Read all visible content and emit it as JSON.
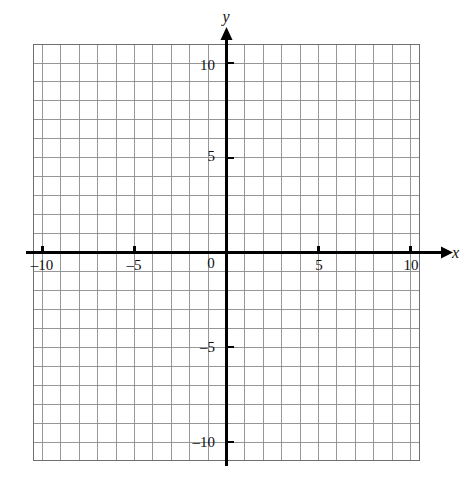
{
  "figure": {
    "background_color": "#ffffff",
    "axis_color": "#000000",
    "grid_color": "#8c8c8c"
  },
  "chart_data": {
    "type": "scatter",
    "title": "",
    "xlabel": "x",
    "ylabel": "y",
    "xlim": [
      -10.5,
      10.5
    ],
    "ylim": [
      -11,
      11
    ],
    "grid": true,
    "grid_step": 1,
    "legend": "none",
    "series": [],
    "x": [],
    "y": [],
    "annotations": [],
    "origin_label": "0",
    "x_tick_labels": [
      "-10",
      "-5",
      "5",
      "10"
    ],
    "x_tick_values": [
      -10,
      -5,
      5,
      10
    ],
    "y_tick_labels": [
      "10",
      "5",
      "-5",
      "-10"
    ],
    "y_tick_values": [
      10,
      5,
      -5,
      -10
    ],
    "minor_tick_values_x": [
      -10,
      -9,
      -8,
      -7,
      -6,
      -5,
      -4,
      -3,
      -2,
      -1,
      0,
      1,
      2,
      3,
      4,
      5,
      6,
      7,
      8,
      9,
      10
    ],
    "minor_tick_values_y": [
      -10,
      -9,
      -8,
      -7,
      -6,
      -5,
      -4,
      -3,
      -2,
      -1,
      0,
      1,
      2,
      3,
      4,
      5,
      6,
      7,
      8,
      9,
      10
    ]
  },
  "labels": {
    "x_axis_name": "x",
    "y_axis_name": "y",
    "origin": "0",
    "x_neg_ten": "–10",
    "x_neg_five": "–5",
    "x_pos_five": "5",
    "x_pos_ten": "10",
    "y_pos_ten": "10",
    "y_pos_five": "5",
    "y_neg_five": "–5",
    "y_neg_ten": "–10"
  }
}
